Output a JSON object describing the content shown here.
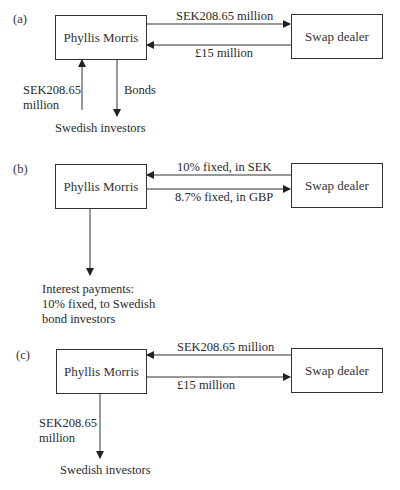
{
  "panels": [
    {
      "tag": "(a)",
      "left_box": "Phyllis Morris",
      "right_box": "Swap dealer",
      "top_arrow_label": "SEK208.65 million",
      "bottom_arrow_label": "£15 million",
      "top_arrow_direction": "right",
      "bottom_arrow_direction": "left",
      "vertical_up_label_line1": "SEK208.65",
      "vertical_up_label_line2": "million",
      "vertical_down_label": "Bonds",
      "bottom_text": "Swedish investors"
    },
    {
      "tag": "(b)",
      "left_box": "Phyllis Morris",
      "right_box": "Swap dealer",
      "top_arrow_label": "10% fixed, in SEK",
      "bottom_arrow_label": "8.7% fixed, in GBP",
      "top_arrow_direction": "left",
      "bottom_arrow_direction": "right",
      "bottom_text_line1": "Interest payments:",
      "bottom_text_line2": "10% fixed, to Swedish",
      "bottom_text_line3": "bond investors"
    },
    {
      "tag": "(c)",
      "left_box": "Phyllis Morris",
      "right_box": "Swap dealer",
      "top_arrow_label": "SEK208.65 million",
      "bottom_arrow_label": "£15 million",
      "top_arrow_direction": "left",
      "bottom_arrow_direction": "right",
      "vertical_down_label_line1": "SEK208.65",
      "vertical_down_label_line2": "million",
      "bottom_text": "Swedish investors"
    }
  ],
  "colors": {
    "line": "#333333",
    "text": "#2a2a2a",
    "background": "#ffffff"
  }
}
